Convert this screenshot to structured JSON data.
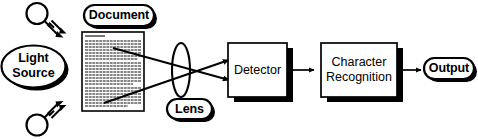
{
  "diagram": {
    "background_color": "#ffffff",
    "ink_color": "#000000",
    "nodes": {
      "light_source": {
        "label": "Light\nSource",
        "label_line1": "Light",
        "label_line2": "Source",
        "shape": "oval-with-shadow",
        "icon_top": "light-bulb-icon",
        "icon_bottom": "light-bulb-icon"
      },
      "document": {
        "label": "Document",
        "shape": "rounded-pill-with-shadow",
        "page": {
          "name": "document-page",
          "heading_present": true,
          "body_text_lines": 34,
          "paragraphs": 4
        }
      },
      "lens": {
        "label": "Lens",
        "shape": "rounded-pill-with-shadow",
        "glyph": "tall-ellipse-lens"
      },
      "detector": {
        "label": "Detector",
        "shape": "rectangle-with-shadow"
      },
      "character_recognition": {
        "label": "Character\nRecognition",
        "label_line1": "Character",
        "label_line2": "Recognition",
        "shape": "rectangle-with-shadow"
      },
      "output": {
        "label": "Output",
        "shape": "rounded-pill-with-shadow"
      }
    },
    "edges": [
      {
        "name": "ray-upper",
        "from": "document",
        "to": "detector",
        "via": "lens",
        "style": "arrow",
        "description": "light ray from document top through lens to detector lower input"
      },
      {
        "name": "ray-lower",
        "from": "document",
        "to": "detector",
        "via": "lens",
        "style": "arrow",
        "description": "light ray from document bottom through lens to detector upper input"
      },
      {
        "name": "detector-to-recognition",
        "from": "detector",
        "to": "character_recognition",
        "style": "arrow"
      },
      {
        "name": "recognition-to-output",
        "from": "character_recognition",
        "to": "output",
        "style": "arrow"
      }
    ]
  }
}
